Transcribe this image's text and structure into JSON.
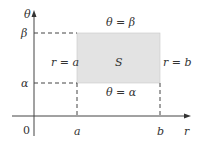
{
  "diagram": {
    "type": "polar rectangle region in r-theta plane",
    "axes": {
      "vertical_label": "θ",
      "horizontal_label": "r",
      "origin_label": "0"
    },
    "ticks": {
      "theta_beta": "β",
      "theta_alpha": "α",
      "r_a": "a",
      "r_b": "b"
    },
    "region": {
      "label": "S",
      "fill": "#e3e3e3",
      "edges": {
        "top": "θ = β",
        "bottom": "θ = α",
        "left": "r = a",
        "right": "r = b"
      }
    },
    "colors": {
      "axis": "#444444",
      "region_fill": "#e3e3e3",
      "text": "#333333"
    }
  }
}
